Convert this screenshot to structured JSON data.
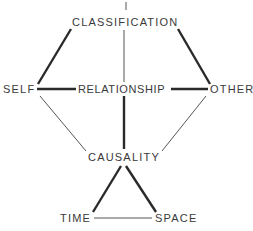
{
  "diagram": {
    "nodes": {
      "classification": "CLASSIFICATION",
      "self": "SELF",
      "relationship": "RELATIONSHIP",
      "other": "OTHER",
      "causality": "CAUSALITY",
      "time": "TIME",
      "space": "SPACE"
    },
    "edges": [
      {
        "from": "CLASSIFICATION",
        "to": "SELF",
        "weight": "thick"
      },
      {
        "from": "CLASSIFICATION",
        "to": "OTHER",
        "weight": "thick"
      },
      {
        "from": "CLASSIFICATION",
        "to": "RELATIONSHIP",
        "weight": "thin"
      },
      {
        "from": "SELF",
        "to": "RELATIONSHIP",
        "weight": "thick"
      },
      {
        "from": "RELATIONSHIP",
        "to": "OTHER",
        "weight": "thick"
      },
      {
        "from": "RELATIONSHIP",
        "to": "CAUSALITY",
        "weight": "thick"
      },
      {
        "from": "SELF",
        "to": "CAUSALITY",
        "weight": "thin"
      },
      {
        "from": "OTHER",
        "to": "CAUSALITY",
        "weight": "thin"
      },
      {
        "from": "CAUSALITY",
        "to": "TIME",
        "weight": "thick"
      },
      {
        "from": "CAUSALITY",
        "to": "SPACE",
        "weight": "thick"
      },
      {
        "from": "TIME",
        "to": "SPACE",
        "weight": "thin"
      }
    ],
    "colors": {
      "line": "#2a2a2a",
      "text": "#3a3a3a",
      "background": "#ffffff"
    }
  }
}
